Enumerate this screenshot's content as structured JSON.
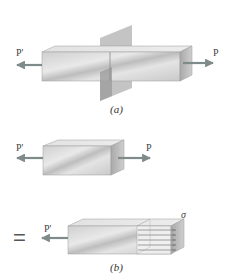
{
  "figure": {
    "part_a": {
      "caption": "(a)",
      "left_force_label": "P'",
      "right_force_label": "P",
      "elements": [
        "prismatic bar",
        "cutting plane",
        "axial load arrows"
      ]
    },
    "free_body": {
      "left_force_label": "P'",
      "right_force_label": "P"
    },
    "part_b": {
      "caption": "(b)",
      "equals_sign": "=",
      "left_force_label": "P'",
      "stress_label": "σ",
      "stress_arrow_count": 5
    },
    "colors": {
      "arrow": "#7f8a8a",
      "bar_face": "#d6d6d6",
      "bar_top": "#e6e6e6",
      "bar_end": "#bdbdbd",
      "plane": "#a7a7a7"
    }
  }
}
